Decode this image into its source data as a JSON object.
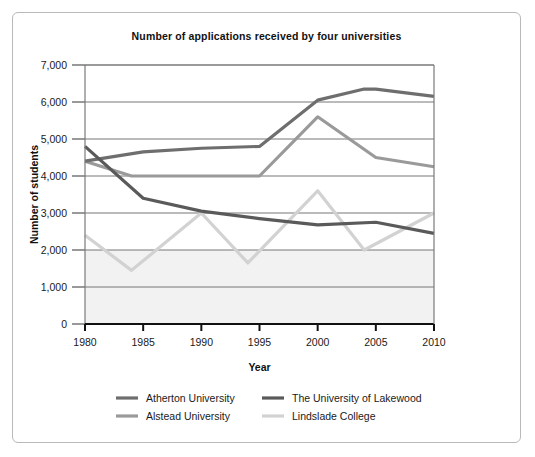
{
  "chart_data": {
    "type": "line",
    "title": "Number of applications received by four universities",
    "xlabel": "Year",
    "ylabel": "Number of students",
    "xlim": [
      1980,
      2010
    ],
    "ylim": [
      0,
      7000
    ],
    "xticks": [
      "1980",
      "1985",
      "1990",
      "1995",
      "2000",
      "2005",
      "2010"
    ],
    "yticks": [
      "0",
      "1,000",
      "2,000",
      "3,000",
      "4,000",
      "5,000",
      "6,000",
      "7,000"
    ],
    "grid": true,
    "legend_position": "bottom",
    "series": [
      {
        "name": "Atherton University",
        "color": "#6e6e6e",
        "points": [
          {
            "x": 1980,
            "y": 4400
          },
          {
            "x": 1985,
            "y": 4650
          },
          {
            "x": 1990,
            "y": 4750
          },
          {
            "x": 1995,
            "y": 4800
          },
          {
            "x": 2000,
            "y": 6050
          },
          {
            "x": 2004,
            "y": 6350
          },
          {
            "x": 2005,
            "y": 6350
          },
          {
            "x": 2010,
            "y": 6150
          }
        ]
      },
      {
        "name": "The University of Lakewood",
        "color": "#5a5a5a",
        "points": [
          {
            "x": 1980,
            "y": 4800
          },
          {
            "x": 1985,
            "y": 3400
          },
          {
            "x": 1990,
            "y": 3050
          },
          {
            "x": 1995,
            "y": 2850
          },
          {
            "x": 2000,
            "y": 2680
          },
          {
            "x": 2005,
            "y": 2750
          },
          {
            "x": 2010,
            "y": 2450
          }
        ]
      },
      {
        "name": "Alstead University",
        "color": "#9a9a9a",
        "points": [
          {
            "x": 1980,
            "y": 4400
          },
          {
            "x": 1984,
            "y": 4000
          },
          {
            "x": 1995,
            "y": 4000
          },
          {
            "x": 2000,
            "y": 5600
          },
          {
            "x": 2005,
            "y": 4500
          },
          {
            "x": 2010,
            "y": 4250
          }
        ]
      },
      {
        "name": "Lindslade College",
        "color": "#d2d2d2",
        "points": [
          {
            "x": 1980,
            "y": 2400
          },
          {
            "x": 1984,
            "y": 1450
          },
          {
            "x": 1990,
            "y": 3000
          },
          {
            "x": 1994,
            "y": 1650
          },
          {
            "x": 2000,
            "y": 3600
          },
          {
            "x": 2004,
            "y": 2000
          },
          {
            "x": 2010,
            "y": 3000
          }
        ]
      }
    ]
  },
  "legend": {
    "entries": [
      {
        "label": "Atherton University"
      },
      {
        "label": "The University of Lakewood"
      },
      {
        "label": "Alstead University"
      },
      {
        "label": "Lindslade College"
      }
    ]
  }
}
